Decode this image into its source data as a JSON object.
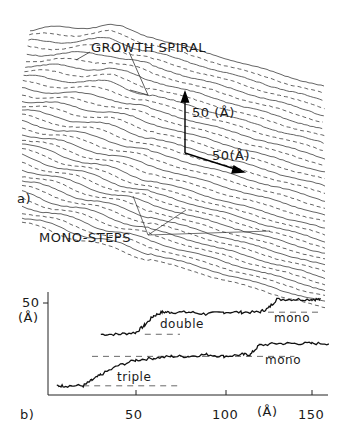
{
  "panel_a": {
    "label": "a)",
    "growth_spiral_label": "GROWTH SPIRAL",
    "mono_steps_label": "MONO-STEPS",
    "scale_vertical": "50 (Å)",
    "scale_horizontal": "50(Å)"
  },
  "panel_b": {
    "label": "b)",
    "y_tick": "50",
    "y_unit": "(Å)",
    "x_ticks": [
      "50",
      "100",
      "150"
    ],
    "x_unit": "(Å)",
    "annotations": [
      "double",
      "mono",
      "triple",
      "mono"
    ]
  },
  "chart_data": {
    "type": "line",
    "title": "",
    "xlabel": "(Å)",
    "ylabel": "(Å)",
    "xlim": [
      0,
      160
    ],
    "ylim": [
      0,
      55
    ],
    "x_ticks": [
      50,
      100,
      150
    ],
    "y_ticks": [
      50
    ],
    "series": [
      {
        "name": "double/mono profile (upper)",
        "x": [
          30,
          40,
          50,
          55,
          60,
          65,
          70,
          80,
          90,
          100,
          110,
          120,
          125,
          130,
          140,
          150,
          155
        ],
        "values": [
          33,
          33,
          34,
          38,
          43,
          45,
          45,
          45,
          44,
          45,
          45,
          45,
          47,
          52,
          52,
          52,
          52
        ]
      },
      {
        "name": "triple/mono profile (lower)",
        "x": [
          5,
          10,
          20,
          25,
          30,
          40,
          50,
          60,
          70,
          80,
          90,
          100,
          110,
          115,
          120,
          130,
          140,
          150,
          160
        ],
        "values": [
          5,
          5,
          5,
          8,
          11,
          16,
          19,
          20,
          21,
          21,
          22,
          21,
          22,
          22,
          27,
          28,
          28,
          28,
          28
        ]
      }
    ],
    "annotations": [
      {
        "text": "double",
        "x": 62,
        "y": 40
      },
      {
        "text": "mono",
        "x": 130,
        "y": 42
      },
      {
        "text": "triple",
        "x": 35,
        "y": 10
      },
      {
        "text": "mono",
        "x": 125,
        "y": 22
      }
    ],
    "reference_lines": [
      {
        "y": 33,
        "x": [
          55,
          75
        ],
        "style": "dashed"
      },
      {
        "y": 45,
        "x": [
          125,
          155
        ],
        "style": "dashed"
      },
      {
        "y": 21,
        "x": [
          25,
          140
        ],
        "style": "dashed"
      },
      {
        "y": 5,
        "x": [
          20,
          75
        ],
        "style": "dashed"
      }
    ],
    "grid": false,
    "legend": "none"
  }
}
